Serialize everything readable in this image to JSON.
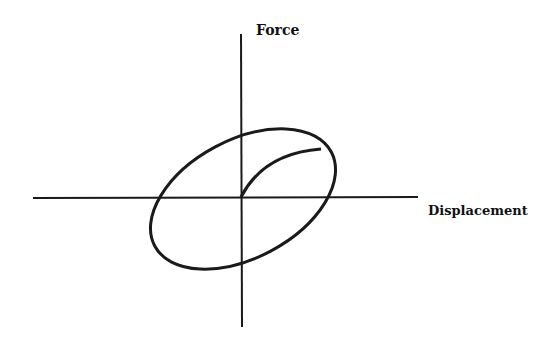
{
  "diagram": {
    "y_axis_label": "Force",
    "x_axis_label": "Displacement",
    "elements": [
      "x-axis",
      "y-axis",
      "hysteresis-ellipse",
      "initial-loading-curve"
    ],
    "colors": {
      "stroke": "#1a1a1a",
      "background": "#ffffff"
    }
  }
}
